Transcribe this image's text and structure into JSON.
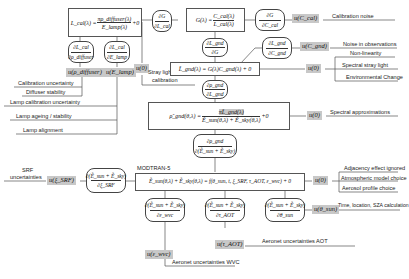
{
  "diagram": {
    "equations": {
      "lcal": {
        "lhs": "L_cal(λ) =",
        "num": "πρ_diffuser(λ)",
        "den": "E_lamp(λ)",
        "tail": "+0"
      },
      "gain": {
        "lhs": "G(λ) =",
        "num": "C_cal(λ)",
        "den": "L_cal(λ)"
      },
      "lgnd": {
        "text": "L̃_gnd(λ) = G(λ)C_gnd(λ) + 0"
      },
      "rho": {
        "lhs": "ρ̃_gnd(θ,λ) =",
        "num": "πL̃_gnd(λ)",
        "den": "Ẽ_sun(θ,λ) + Ẽ_sky(θ,λ)",
        "tail": "+0"
      },
      "modtran": {
        "label": "MODTRAN-5",
        "text": "Ẽ_sun(θ,λ) + Ẽ_sky(θ,λ) = f(θ_sun, t, ξ_SRF, τ_AOT, ε_wvc) + 0"
      }
    },
    "sensitivities": {
      "d_lcal_drho": {
        "num": "∂L_cal",
        "den": "∂ρ_diffuser"
      },
      "d_lcal_delamp": {
        "num": "∂L_cal",
        "den": "∂E_lamp"
      },
      "d_g_dlcal": {
        "num": "∂G",
        "den": "∂L_cal"
      },
      "d_g_dccal": {
        "num": "∂G",
        "den": "∂C_cal"
      },
      "d_lgnd_dg": {
        "num": "∂L_gnd",
        "den": "∂G"
      },
      "d_lgnd_dcgnd": {
        "num": "∂L_gnd",
        "den": "∂C_gnd"
      },
      "d_rho_dlgnd": {
        "num": "∂ρ_gnd",
        "den": "∂L_gnd"
      },
      "d_rho_de": {
        "num": "∂ρ_gnd",
        "den": "∂(Ẽ_sun + Ẽ_sky)"
      },
      "d_e_dsrf": {
        "num": "∂(Ẽ_sun + Ẽ_sky)",
        "den": "∂ξ_SRF"
      },
      "d_e_dwvc": {
        "num": "∂(Ẽ_sun + Ẽ_sky)",
        "den": "∂ε_wvc"
      },
      "d_e_daot": {
        "num": "∂(Ẽ_sun + Ẽ_sky)",
        "den": "∂τ_AOT"
      },
      "d_e_dsun": {
        "num": "∂(Ẽ_sun + Ẽ_sky)",
        "den": "∂θ_sun"
      }
    },
    "uncertainty_terms": {
      "u_rho_diffuser": "u(ρ_diffuser)",
      "u_elamp": "u(E_lamp)",
      "u_zero_cal": "u(0)",
      "u_ccal": "u(C_cal)",
      "u_cgnd": "u(C_gnd)",
      "u_zero_lgnd": "u(0)",
      "u_zero_rho": "u(0)",
      "u_srf": "u(ξ_SRF)",
      "u_zero_modtran": "u(0)",
      "u_theta_sun": "u(θ_sun)",
      "u_aot": "u(τ_AOT)",
      "u_wvc": "u(ε_wvc)"
    },
    "sources": {
      "calibration_uncertainty": "Calibration uncertainty",
      "diffuser_stability": "Diffuser stability",
      "lamp_calibration_uncertainty": "Lamp calibration uncertainty",
      "lamp_ageing": "Lamp ageing / stability",
      "lamp_alignment": "Lamp alignment",
      "stray_light_line1": "Stray light in",
      "stray_light_line2": "calibration",
      "calibration_noise": "Calibration noise",
      "noise_in_observations": "Noise in observations",
      "non_linearity": "Non-linearity",
      "spectral_stray_light": "Spectral stray light",
      "environmental_change": "Environmental Change",
      "spectral_approximations": "Spectral approximations",
      "srf_line1": "SRF",
      "srf_line2": "uncertainties",
      "adjacency_effect": "Adjacency effect ignored",
      "atmospheric_model": "Atmospheric model choice",
      "aerosol_profile": "Aerosol profile choice",
      "time_location_sza": "Time, location, SZA calculation",
      "aeronet_aot": "Aeronet uncertainties AOT",
      "aeronet_wvc": "Aeronet uncertainties WVC"
    }
  }
}
